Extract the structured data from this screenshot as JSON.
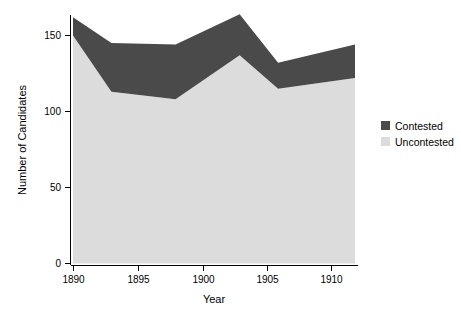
{
  "chart_data": {
    "type": "area",
    "title": "",
    "subtitle": "",
    "xlabel": "Year",
    "ylabel": "Number of Candidates",
    "stacked": true,
    "grid": false,
    "legend_position": "right",
    "xlim": [
      1890,
      1912
    ],
    "ylim": [
      0,
      165
    ],
    "x": [
      1890,
      1893,
      1898,
      1903,
      1906,
      1912
    ],
    "xticks": [
      1890,
      1895,
      1900,
      1905,
      1910
    ],
    "xticklabels": [
      "1890",
      "1895",
      "1900",
      "1905",
      "1910"
    ],
    "yticks": [
      0,
      50,
      100,
      150
    ],
    "yticklabels": [
      "0",
      "50",
      "100",
      "150"
    ],
    "series": [
      {
        "name": "Uncontested",
        "color": "#dcdcdc",
        "values": [
          150,
          113,
          108,
          137,
          115,
          122
        ]
      },
      {
        "name": "Contested",
        "color": "#4a4a4a",
        "values": [
          12,
          32,
          36,
          27,
          17,
          22
        ]
      }
    ],
    "totals": [
      162,
      145,
      144,
      164,
      132,
      144
    ]
  },
  "legend": {
    "items": [
      {
        "label": "Contested",
        "color": "#4a4a4a"
      },
      {
        "label": "Uncontested",
        "color": "#dcdcdc"
      }
    ]
  },
  "axes": {
    "x_title": "Year",
    "y_title": "Number of Candidates",
    "x_tick_labels": [
      "1890",
      "1895",
      "1900",
      "1905",
      "1910"
    ],
    "y_tick_labels": [
      "0",
      "50",
      "100",
      "150"
    ]
  },
  "colors": {
    "contested": "#4a4a4a",
    "uncontested": "#dcdcdc",
    "axis": "#000000",
    "background": "#ffffff"
  }
}
